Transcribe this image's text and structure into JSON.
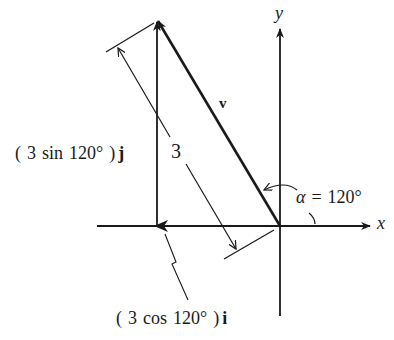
{
  "diagram": {
    "type": "vector-decomposition",
    "colors": {
      "ink": "#1a1a1a",
      "background": "#ffffff"
    },
    "axes": {
      "x_label": "x",
      "y_label": "y"
    },
    "vector": {
      "label": "v",
      "magnitude_label": "3"
    },
    "angle": {
      "symbol": "α",
      "equals": "=",
      "value": "120°"
    },
    "components": {
      "vertical": {
        "open": "(",
        "coef": "3",
        "func": "sin",
        "arg": "120°",
        "close": ")",
        "unit": "j"
      },
      "horizontal": {
        "open": "(",
        "coef": "3",
        "func": "cos",
        "arg": "120°",
        "close": ")",
        "unit": "i"
      }
    }
  }
}
